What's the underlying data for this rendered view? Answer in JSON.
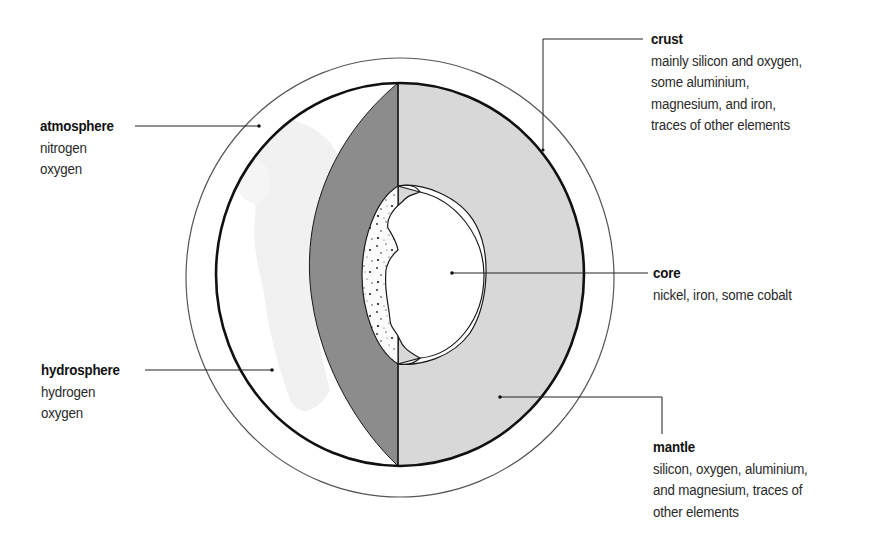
{
  "diagram": {
    "type": "earth-cross-section",
    "colors": {
      "background": "#ffffff",
      "outline": "#1a1a1a",
      "mantle_fill": "#d8d8d8",
      "lower_mantle_fill": "#8c8c8c",
      "core_fill": "#ffffff",
      "outer_core_fill": "#fbfbfb",
      "hydrosphere_fill": "#f3f3f3"
    },
    "labels": {
      "atmosphere": {
        "title": "atmosphere",
        "lines": [
          "nitrogen",
          "oxygen"
        ]
      },
      "hydrosphere": {
        "title": "hydrosphere",
        "lines": [
          "hydrogen",
          "oxygen"
        ]
      },
      "crust": {
        "title": "crust",
        "lines": [
          "mainly silicon and oxygen,",
          "some aluminium,",
          "magnesium, and iron,",
          "traces of other elements"
        ]
      },
      "core": {
        "title": "core",
        "lines": [
          "nickel, iron, some cobalt"
        ]
      },
      "mantle": {
        "title": "mantle",
        "lines": [
          "silicon, oxygen, aluminium,",
          "and magnesium, traces of",
          "other elements"
        ]
      }
    }
  }
}
